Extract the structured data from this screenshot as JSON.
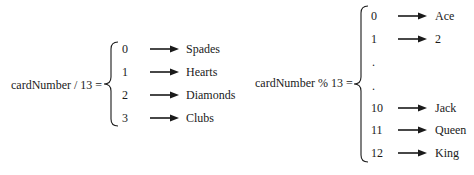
{
  "left": {
    "expression": "cardNumber / 13 =",
    "rows": [
      {
        "value": "0",
        "label": "Spades"
      },
      {
        "value": "1",
        "label": "Hearts"
      },
      {
        "value": "2",
        "label": "Diamonds"
      },
      {
        "value": "3",
        "label": "Clubs"
      }
    ]
  },
  "right": {
    "expression": "cardNumber % 13 =",
    "rows": [
      {
        "value": "0",
        "label": "Ace"
      },
      {
        "value": "1",
        "label": "2"
      },
      {
        "value": ".",
        "label": ""
      },
      {
        "value": ".",
        "label": ""
      },
      {
        "value": "10",
        "label": "Jack"
      },
      {
        "value": "11",
        "label": "Queen"
      },
      {
        "value": "12",
        "label": "King"
      }
    ]
  },
  "icons": {
    "arrow": "right-arrow-icon",
    "brace": "left-curly-brace"
  }
}
